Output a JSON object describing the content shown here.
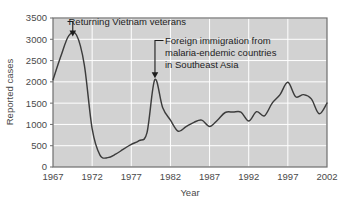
{
  "chart_data": {
    "type": "line",
    "title": "",
    "subtitle": "",
    "xlabel": "Year",
    "ylabel": "Reported cases",
    "xlim": [
      1967,
      2002
    ],
    "ylim": [
      0,
      3500
    ],
    "grid": true,
    "grid_color": "#ffffff",
    "plot_background": "#d2d2d2",
    "line_color": "#3c3c3c",
    "legend": null,
    "legend_position": "none",
    "xticks": [
      1967,
      1972,
      1977,
      1982,
      1987,
      1992,
      1997,
      2002
    ],
    "xtick_labels": [
      "1967",
      "1972",
      "1977",
      "1982",
      "1987",
      "1992",
      "1997",
      "2002"
    ],
    "yticks": [
      0,
      500,
      1000,
      1500,
      2000,
      2500,
      3000,
      3500
    ],
    "ytick_labels": [
      "0",
      "500",
      "1000",
      "1500",
      "2000",
      "2500",
      "3000",
      "3500"
    ],
    "series": [
      {
        "name": "Reported malaria cases",
        "x": [
          1967,
          1968,
          1969,
          1970,
          1971,
          1972,
          1973,
          1974,
          1975,
          1976,
          1977,
          1978,
          1979,
          1980,
          1981,
          1982,
          1983,
          1984,
          1985,
          1986,
          1987,
          1988,
          1989,
          1990,
          1991,
          1992,
          1993,
          1994,
          1995,
          1996,
          1997,
          1998,
          1999,
          2000,
          2001,
          2002
        ],
        "values": [
          2050,
          2600,
          3080,
          3100,
          2400,
          900,
          280,
          220,
          300,
          420,
          530,
          620,
          800,
          2050,
          1400,
          1100,
          840,
          950,
          1050,
          1100,
          950,
          1100,
          1280,
          1290,
          1290,
          1080,
          1300,
          1200,
          1500,
          1700,
          1990,
          1650,
          1700,
          1600,
          1250,
          1500
        ]
      }
    ],
    "annotations": [
      {
        "name": "vietnam-veterans-annotation",
        "text": "Returning Vietnam veterans",
        "target_x": 1969.5,
        "target_y": 3100
      },
      {
        "name": "foreign-immigration-annotation",
        "lines": [
          "Foreign immigration from",
          "malaria-endemic countries",
          "in Southeast Asia"
        ],
        "target_x": 1980,
        "target_y": 2050
      }
    ]
  },
  "figure": {
    "y_axis_label": "Reported cases",
    "x_axis_label": "Year"
  }
}
